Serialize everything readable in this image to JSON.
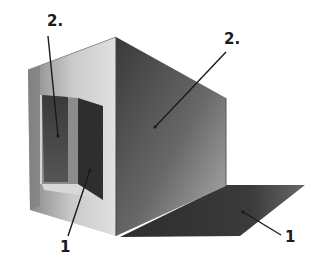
{
  "image": {
    "description": "Pencil drawing of a box in two-point perspective with an open door on the left face, casting a shadow on the ground",
    "labels": [
      {
        "id": "label-2-left",
        "text": "2.",
        "x": 47,
        "y": 14
      },
      {
        "id": "label-2-right",
        "text": "2.",
        "x": 224,
        "y": 32
      },
      {
        "id": "label-1-door",
        "text": "1",
        "x": 60,
        "y": 242
      },
      {
        "id": "label-1-shadow",
        "text": "1",
        "x": 285,
        "y": 232
      }
    ],
    "colors": {
      "background": "#ffffff",
      "pencil_dark": "#2a2a2a",
      "pencil_mid": "#6e6e6e",
      "pencil_light": "#c9c9c9",
      "shadow": "#3a3a3a"
    }
  }
}
